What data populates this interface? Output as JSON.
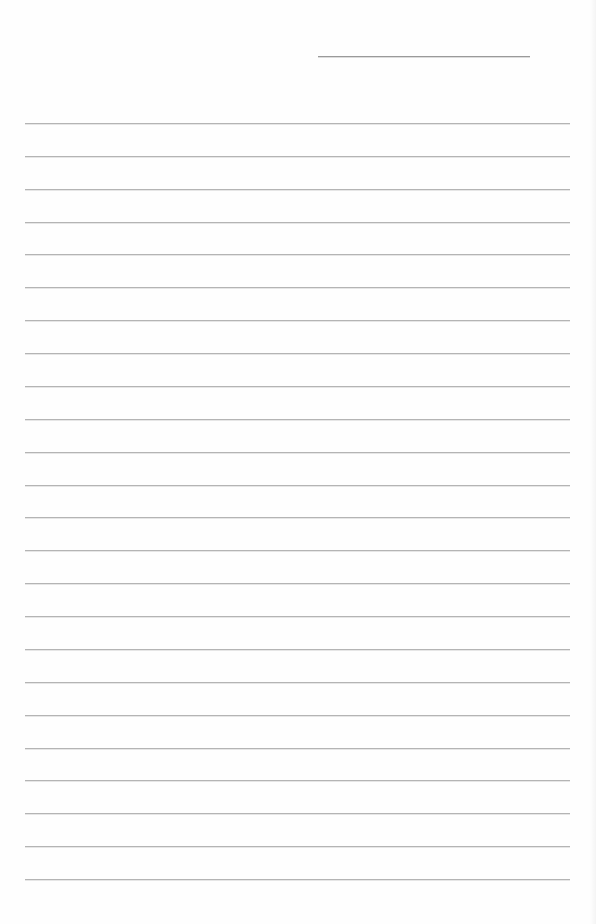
{
  "page": {
    "type": "lined-paper",
    "background_color": "#fefefe",
    "line_color": "#b4b4b4"
  },
  "header": {
    "name_line": {
      "label": "",
      "value": ""
    }
  },
  "ruled_lines": {
    "count": 24,
    "first_y": 123,
    "last_y": 879,
    "left_x": 25,
    "right_x": 570,
    "lines": [
      {
        "text": ""
      },
      {
        "text": ""
      },
      {
        "text": ""
      },
      {
        "text": ""
      },
      {
        "text": ""
      },
      {
        "text": ""
      },
      {
        "text": ""
      },
      {
        "text": ""
      },
      {
        "text": ""
      },
      {
        "text": ""
      },
      {
        "text": ""
      },
      {
        "text": ""
      },
      {
        "text": ""
      },
      {
        "text": ""
      },
      {
        "text": ""
      },
      {
        "text": ""
      },
      {
        "text": ""
      },
      {
        "text": ""
      },
      {
        "text": ""
      },
      {
        "text": ""
      },
      {
        "text": ""
      },
      {
        "text": ""
      },
      {
        "text": ""
      },
      {
        "text": ""
      }
    ]
  }
}
